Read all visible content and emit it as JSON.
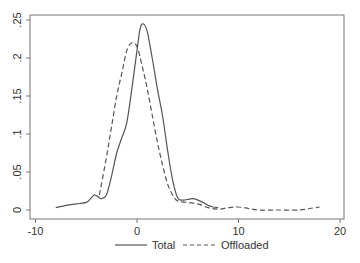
{
  "chart_data": {
    "type": "line",
    "title": "",
    "xlabel": "",
    "ylabel": "",
    "xlim": [
      -11,
      20.5
    ],
    "ylim": [
      -0.012,
      0.257
    ],
    "x_ticks": [
      -10,
      0,
      10,
      20
    ],
    "x_tick_labels": [
      "-10",
      "0",
      "10",
      "20"
    ],
    "y_ticks": [
      0,
      0.05,
      0.1,
      0.15,
      0.2,
      0.25
    ],
    "y_tick_labels": [
      "0",
      ".05",
      ".1",
      ".15",
      ".2",
      ".25"
    ],
    "grid": false,
    "legend_position": "bottom",
    "series": [
      {
        "name": "Total",
        "style": "solid",
        "color": "#555555",
        "x": [
          -8,
          -7,
          -6,
          -5,
          -4.5,
          -4.2,
          -3.8,
          -3.5,
          -3,
          -2.5,
          -2,
          -1.5,
          -1,
          -0.5,
          0,
          0.3,
          0.6,
          1,
          1.5,
          2,
          2.5,
          3,
          3.5,
          4,
          4.5,
          5,
          5.5,
          6,
          6.5,
          7,
          7.5,
          8
        ],
        "y": [
          0.003,
          0.006,
          0.008,
          0.01,
          0.016,
          0.02,
          0.017,
          0.015,
          0.02,
          0.045,
          0.075,
          0.095,
          0.115,
          0.16,
          0.21,
          0.238,
          0.245,
          0.235,
          0.2,
          0.16,
          0.125,
          0.08,
          0.04,
          0.016,
          0.013,
          0.014,
          0.015,
          0.013,
          0.01,
          0.006,
          0.004,
          0.003
        ]
      },
      {
        "name": "Offloaded",
        "style": "dashed",
        "color": "#555555",
        "x": [
          -3.7,
          -3,
          -2.5,
          -2,
          -1.5,
          -1,
          -0.5,
          0,
          0.5,
          1,
          1.5,
          2,
          2.5,
          3,
          3.5,
          4,
          5,
          6,
          7,
          8,
          9,
          10,
          11,
          12,
          14,
          16,
          17,
          18
        ],
        "y": [
          0.02,
          0.07,
          0.11,
          0.15,
          0.18,
          0.21,
          0.22,
          0.215,
          0.19,
          0.16,
          0.125,
          0.09,
          0.06,
          0.035,
          0.02,
          0.012,
          0.01,
          0.008,
          0.003,
          0.001,
          0.003,
          0.004,
          0.002,
          0.0,
          0.0,
          0.0,
          0.002,
          0.004
        ]
      }
    ]
  }
}
